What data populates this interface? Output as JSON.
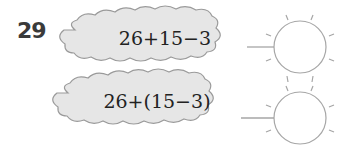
{
  "problem": {
    "number": "29",
    "items": [
      {
        "expression": "26+15−3",
        "answer": ""
      },
      {
        "expression": "26+(15−3)",
        "answer": ""
      }
    ]
  },
  "colors": {
    "cloud_fill": "#e6e6e6",
    "cloud_stroke": "#9a9a9a",
    "circle_stroke": "#a6a6a6",
    "number_color": "#3a3a3a"
  }
}
